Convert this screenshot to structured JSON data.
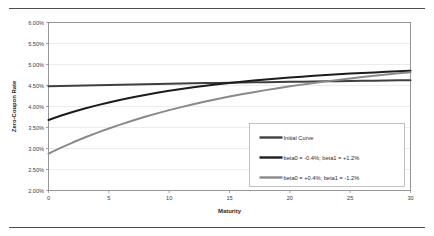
{
  "figure": {
    "background_color": "#ffffff",
    "rule_color": "#4d4d4d",
    "has_top_rule": true,
    "has_bottom_rule": true
  },
  "chart_data": {
    "type": "line",
    "title": "",
    "xlabel": "Maturity",
    "ylabel": "Zero-Coupon Rate",
    "xlim": [
      0,
      30
    ],
    "ylim": [
      0.02,
      0.06
    ],
    "grid": true,
    "legend_position": "lower-right-inside",
    "x_ticks": [
      0,
      5,
      10,
      15,
      20,
      25,
      30
    ],
    "x_tick_labels": [
      "0",
      "5",
      "10",
      "15",
      "20",
      "25",
      "30"
    ],
    "y_ticks": [
      0.02,
      0.025,
      0.03,
      0.035,
      0.04,
      0.045,
      0.05,
      0.055,
      0.06
    ],
    "y_tick_labels": [
      "2.00%",
      "2.50%",
      "3.00%",
      "3.50%",
      "4.00%",
      "4.50%",
      "5.00%",
      "5.50%",
      "6.00%"
    ],
    "x": [
      0,
      1,
      2,
      3,
      4,
      5,
      6,
      7,
      8,
      9,
      10,
      11,
      12,
      13,
      14,
      15,
      16,
      17,
      18,
      19,
      20,
      21,
      22,
      23,
      24,
      25,
      26,
      27,
      28,
      29,
      30
    ],
    "series": [
      {
        "name": "Initial Curve",
        "color": "#3f3f3f",
        "width": 2.0,
        "values": [
          0.0448,
          0.04487,
          0.04494,
          0.04501,
          0.04507,
          0.04513,
          0.04519,
          0.04525,
          0.04531,
          0.04536,
          0.04542,
          0.04547,
          0.04552,
          0.04557,
          0.04562,
          0.04566,
          0.04571,
          0.04575,
          0.0458,
          0.04584,
          0.04588,
          0.04592,
          0.04596,
          0.046,
          0.04604,
          0.04608,
          0.04612,
          0.04616,
          0.04619,
          0.04623,
          0.04627
        ]
      },
      {
        "name": "beta0 = -0.4%; beta1 = +1.2%",
        "color": "#1c1c1c",
        "width": 2.0,
        "values": [
          0.0368,
          0.03778,
          0.03868,
          0.03951,
          0.04027,
          0.04097,
          0.04162,
          0.04221,
          0.04276,
          0.04326,
          0.04373,
          0.04416,
          0.04456,
          0.04493,
          0.04528,
          0.0456,
          0.0459,
          0.04617,
          0.04643,
          0.04667,
          0.0469,
          0.04711,
          0.04731,
          0.04749,
          0.04767,
          0.04783,
          0.04798,
          0.04812,
          0.04826,
          0.04839,
          0.04851
        ]
      },
      {
        "name": "beta0 = +0.4%; beta1 = -1.2%",
        "color": "#8a8a8a",
        "width": 2.0,
        "values": [
          0.0288,
          0.03015,
          0.03142,
          0.03261,
          0.03372,
          0.03477,
          0.03575,
          0.03667,
          0.03754,
          0.03836,
          0.03913,
          0.03985,
          0.04053,
          0.04118,
          0.04178,
          0.04236,
          0.0429,
          0.04341,
          0.0439,
          0.04436,
          0.0448,
          0.04521,
          0.04561,
          0.04598,
          0.04634,
          0.04668,
          0.047,
          0.04731,
          0.04761,
          0.04789,
          0.04816
        ]
      }
    ],
    "legend_entries": [
      {
        "label": "Initial Curve",
        "color": "#3f3f3f"
      },
      {
        "label": "beta0 = -0.4%; beta1 = +1.2%",
        "color": "#1c1c1c"
      },
      {
        "label": "beta0 = +0.4%; beta1 = -1.2%",
        "color": "#8a8a8a"
      }
    ]
  }
}
